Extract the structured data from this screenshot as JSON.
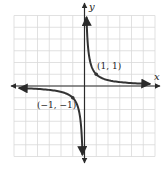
{
  "chart_data": {
    "type": "line",
    "title": "",
    "function": "y = 1/x",
    "xlabel": "x",
    "ylabel": "y",
    "xlim": [
      -6,
      6
    ],
    "ylim": [
      -6,
      6
    ],
    "grid": true,
    "grid_step": 1,
    "series": [
      {
        "name": "right-branch",
        "x": [
          0.17,
          0.25,
          0.5,
          1,
          2,
          3,
          4,
          5,
          5.6
        ],
        "y": [
          5.9,
          4,
          2,
          1,
          0.5,
          0.333,
          0.25,
          0.2,
          0.18
        ]
      },
      {
        "name": "left-branch",
        "x": [
          -5.6,
          -5,
          -4,
          -3,
          -2,
          -1,
          -0.5,
          -0.25,
          -0.17
        ],
        "y": [
          -0.18,
          -0.2,
          -0.25,
          -0.333,
          -0.5,
          -1,
          -2,
          -4,
          -5.9
        ]
      }
    ],
    "annotations": [
      {
        "text": "(1, 1)",
        "x": 1,
        "y": 1
      },
      {
        "text": "(−1, −1)",
        "x": -1,
        "y": -1
      }
    ]
  },
  "labels": {
    "x_axis": "x",
    "y_axis": "y",
    "point_pos": "(1, 1)",
    "point_neg": "(−1, −1)"
  },
  "colors": {
    "curve": "#333333",
    "axis": "#2a2a2a",
    "grid": "#d9d9d9"
  }
}
